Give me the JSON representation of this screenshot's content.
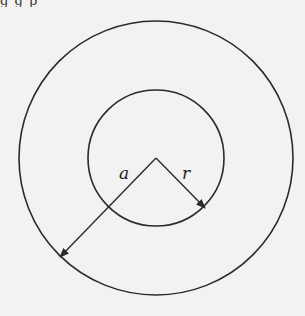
{
  "header": {
    "cropped_text": "g   g                                  p"
  },
  "diagram": {
    "center": {
      "x": 156,
      "y": 158
    },
    "outer_circle": {
      "r": 137
    },
    "inner_circle": {
      "r": 68
    },
    "labels": {
      "a": "a",
      "r": "r"
    },
    "stroke_color": "#2a2a2a",
    "background_color": "#f2f2f0"
  }
}
